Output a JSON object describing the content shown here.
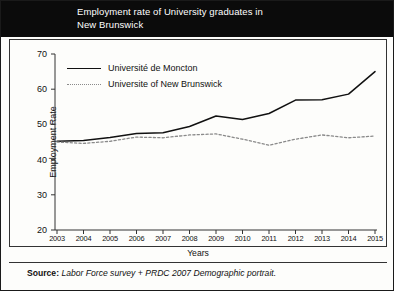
{
  "title": "Employment rate of University graduates in\nNew Brunswick",
  "axis": {
    "ylabel": "Employment Rate",
    "xlabel": "Years"
  },
  "source": {
    "prefix": "Source:",
    "text": " Labor Force survey + PRDC 2007 Demographic portrait."
  },
  "colors": {
    "title_bar": "#0b0b0b",
    "moncton_line": "#111111",
    "unb_line": "#8a8a8a",
    "frame": "#333333"
  },
  "chart_data": {
    "type": "line",
    "title": "Employment rate of University graduates in New Brunswick",
    "xlabel": "Years",
    "ylabel": "Employment Rate",
    "grid": false,
    "legend_position": "top-left",
    "ylim": [
      20,
      70
    ],
    "yticks": [
      20,
      30,
      40,
      50,
      60,
      70
    ],
    "categories": [
      2003,
      2004,
      2005,
      2006,
      2007,
      2008,
      2009,
      2010,
      2011,
      2012,
      2013,
      2014,
      2015
    ],
    "series": [
      {
        "name": "Université de Moncton",
        "style": "solid",
        "values": [
          45.2,
          45.4,
          46.3,
          47.4,
          47.6,
          49.4,
          52.4,
          51.4,
          53.1,
          56.9,
          57.0,
          58.6,
          65.0
        ]
      },
      {
        "name": "Universite of New Brunswick",
        "style": "dotted",
        "values": [
          45.0,
          44.6,
          45.2,
          46.4,
          46.2,
          47.0,
          47.3,
          45.8,
          44.1,
          45.8,
          47.0,
          46.2,
          46.7
        ]
      }
    ]
  }
}
